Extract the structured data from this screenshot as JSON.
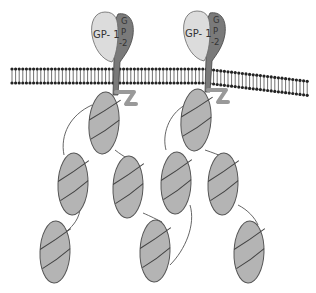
{
  "diagram": {
    "type": "glycoprotein-complex-schematic",
    "labels": {
      "gp1": "GP- 1",
      "gp2_g": "G",
      "gp2_p": "P",
      "gp2_2": "-2"
    },
    "colors": {
      "gp1_fill": "#dcdcdc",
      "gp2_fill": "#7a7a7a",
      "domain_fill": "#b4b4b4",
      "outline": "#555555",
      "membrane": "#222222",
      "linker": "#555555"
    },
    "components": [
      {
        "name": "GP-1",
        "role": "surface subunit",
        "count": 2
      },
      {
        "name": "GP-2",
        "role": "transmembrane subunit",
        "count": 2
      },
      {
        "name": "membrane",
        "role": "lipid bilayer"
      },
      {
        "name": "intracellular domains",
        "count": 10
      }
    ]
  }
}
